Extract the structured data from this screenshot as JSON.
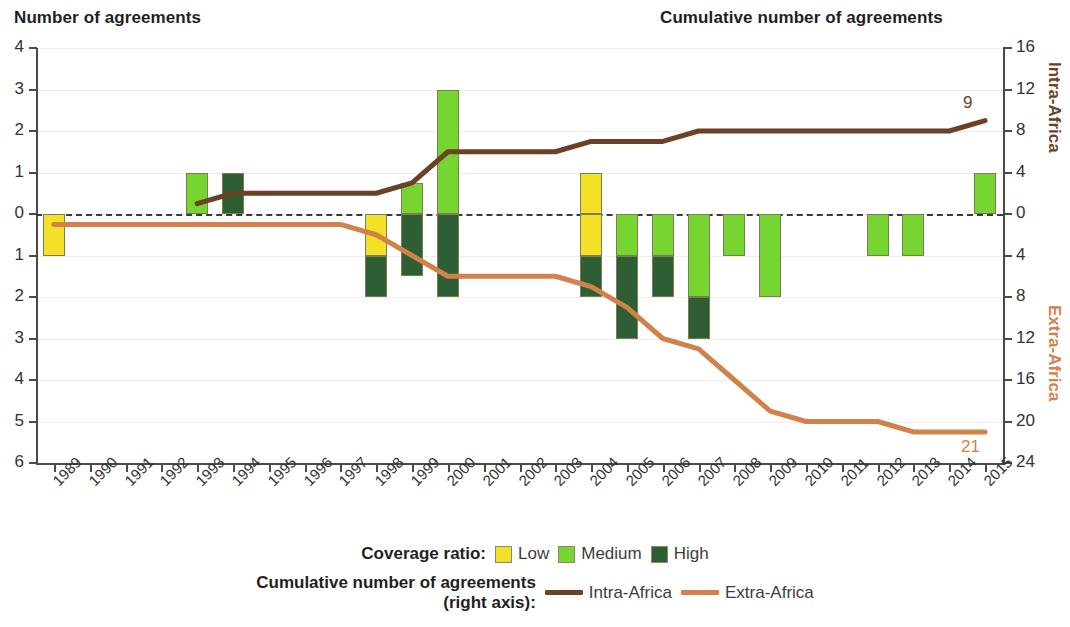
{
  "header": {
    "left_axis_title": "Number of agreements",
    "right_axis_title": "Cumulative number of agreements"
  },
  "right_axis_groups": {
    "upper": "Intra-Africa",
    "lower": "Extra-Africa"
  },
  "legend": {
    "coverage_label": "Coverage ratio:",
    "items": [
      {
        "label": "Low",
        "color": "#F5E028"
      },
      {
        "label": "Medium",
        "color": "#77D531"
      },
      {
        "label": "High",
        "color": "#2E5E34"
      }
    ],
    "cumulative_label_line1": "Cumulative number of agreements",
    "cumulative_label_line2": "(right axis):",
    "lines": [
      {
        "label": "Intra-Africa",
        "color": "#6B4226"
      },
      {
        "label": "Extra-Africa",
        "color": "#D1824A"
      }
    ]
  },
  "annotations": {
    "intra_end_value": "9",
    "extra_end_value": "21"
  },
  "chart_data": {
    "type": "bar",
    "title": "",
    "xlabel": "",
    "ylabel": "Number of agreements",
    "y2label": "Cumulative number of agreements",
    "grid": true,
    "legend_position": "bottom",
    "categories": [
      "1989",
      "1990",
      "1991",
      "1992",
      "1993",
      "1994",
      "1995",
      "1996",
      "1997",
      "1998",
      "1999",
      "2000",
      "2001",
      "2002",
      "2003",
      "2004",
      "2005",
      "2006",
      "2007",
      "2008",
      "2009",
      "2010",
      "2011",
      "2012",
      "2013",
      "2014",
      "2015"
    ],
    "ylim": [
      -6,
      4
    ],
    "ytick_labels": [
      "4",
      "3",
      "2",
      "1",
      "0",
      "1",
      "2",
      "3",
      "4",
      "5",
      "6"
    ],
    "ytick_values": [
      4,
      3,
      2,
      1,
      0,
      -1,
      -2,
      -3,
      -4,
      -5,
      -6
    ],
    "y2lim": [
      -24,
      16
    ],
    "y2tick_labels": [
      "16",
      "12",
      "8",
      "4",
      "0",
      "4",
      "8",
      "12",
      "16",
      "20",
      "24"
    ],
    "y2tick_values": [
      16,
      12,
      8,
      4,
      0,
      -4,
      -8,
      -12,
      -16,
      -20,
      -24
    ],
    "note": "Bars above zero = Intra-Africa agreements; bars below zero = Extra-Africa agreements. Stacked by coverage ratio.",
    "series": [
      {
        "name": "Low",
        "color": "#F5E028",
        "above": [
          0,
          0,
          0,
          0,
          0,
          0,
          0,
          0,
          0,
          0,
          0,
          0,
          0,
          0,
          0,
          1,
          0,
          0,
          0,
          0,
          0,
          0,
          0,
          0,
          0,
          0,
          0
        ],
        "below": [
          1,
          0,
          0,
          0,
          0,
          0,
          0,
          0,
          0,
          1,
          0,
          0,
          0,
          0,
          0,
          1,
          0,
          0,
          0,
          0,
          0,
          0,
          0,
          0,
          0,
          0,
          0
        ]
      },
      {
        "name": "Medium",
        "color": "#77D531",
        "above": [
          0,
          0,
          0,
          0,
          1,
          0,
          0,
          0,
          0,
          0,
          0.75,
          3,
          0,
          0,
          0,
          0,
          0,
          0,
          0,
          0,
          0,
          0,
          0,
          0,
          0,
          0,
          1
        ],
        "below": [
          0,
          0,
          0,
          0,
          0,
          0,
          0,
          0,
          0,
          0,
          0,
          0,
          0,
          0,
          0,
          0,
          1,
          1,
          2,
          1,
          2,
          0,
          0,
          1,
          1,
          0,
          0
        ]
      },
      {
        "name": "High",
        "color": "#2E5E34",
        "above": [
          0,
          0,
          0,
          0,
          0,
          1,
          0,
          0,
          0,
          0,
          0,
          0,
          0,
          0,
          0,
          0,
          0,
          0,
          0,
          0,
          0,
          0,
          0,
          0,
          0,
          0,
          0
        ],
        "below": [
          0,
          0,
          0,
          0,
          0,
          0,
          0,
          0,
          0,
          1,
          1.5,
          2,
          0,
          0,
          0,
          1,
          2,
          1,
          1,
          0,
          0,
          0,
          0,
          0,
          0,
          0,
          0
        ]
      }
    ],
    "lines": [
      {
        "name": "Intra-Africa",
        "color": "#6B4226",
        "axis": "right",
        "x": [
          "1993",
          "1994",
          "1995",
          "1996",
          "1997",
          "1998",
          "1999",
          "2000",
          "2001",
          "2002",
          "2003",
          "2004",
          "2005",
          "2006",
          "2007",
          "2008",
          "2009",
          "2010",
          "2011",
          "2012",
          "2013",
          "2014",
          "2015"
        ],
        "values": [
          1,
          2,
          2,
          2,
          2,
          2,
          3,
          6,
          6,
          6,
          6,
          7,
          7,
          7,
          8,
          8,
          8,
          8,
          8,
          8,
          8,
          8,
          9
        ],
        "end_label": "9"
      },
      {
        "name": "Extra-Africa",
        "color": "#D1824A",
        "axis": "right",
        "x": [
          "1989",
          "1990",
          "1991",
          "1992",
          "1993",
          "1994",
          "1995",
          "1996",
          "1997",
          "1998",
          "1999",
          "2000",
          "2001",
          "2002",
          "2003",
          "2004",
          "2005",
          "2006",
          "2007",
          "2008",
          "2009",
          "2010",
          "2011",
          "2012",
          "2013",
          "2014",
          "2015"
        ],
        "values": [
          1,
          1,
          1,
          1,
          1,
          1,
          1,
          1,
          1,
          2,
          4,
          6,
          6,
          6,
          6,
          7,
          9,
          12,
          13,
          16,
          19,
          20,
          20,
          20,
          21,
          21,
          21
        ],
        "end_label": "21"
      }
    ]
  }
}
